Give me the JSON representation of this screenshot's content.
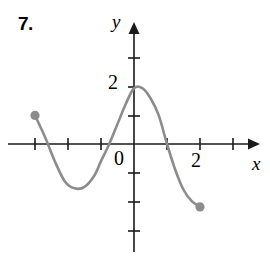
{
  "problem": {
    "number": "7."
  },
  "axes": {
    "y_axis_label": "y",
    "x_axis_label": "x",
    "origin_label": "0",
    "y_tick_label_2": "2",
    "x_tick_label_2": "2",
    "axis_color": "#1a1a1a"
  },
  "chart_data": {
    "type": "line",
    "title": "",
    "xlabel": "x",
    "ylabel": "y",
    "xlim": [
      -4,
      3.6
    ],
    "ylim": [
      -4.1,
      4.1
    ],
    "grid": false,
    "legend": null,
    "curve_color": "#8c8c8c",
    "endpoint_marker": "filled-circle",
    "x_ticks": [
      -3,
      -2,
      -1,
      1,
      2,
      3
    ],
    "y_ticks": [
      -3,
      -2,
      -1,
      1,
      2,
      3
    ],
    "x_tick_labels_shown": [
      {
        "x": 0,
        "label": "0"
      },
      {
        "x": 2,
        "label": "2"
      }
    ],
    "y_tick_labels_shown": [
      {
        "y": 2,
        "label": "2"
      }
    ],
    "series": [
      {
        "name": "f",
        "domain": [
          -3.0,
          2.0
        ],
        "closed_endpoints": true,
        "points": [
          {
            "x": -3.0,
            "y": 1.0
          },
          {
            "x": -2.7,
            "y": 0.25
          },
          {
            "x": -2.4,
            "y": -0.6
          },
          {
            "x": -2.1,
            "y": -1.3
          },
          {
            "x": -1.8,
            "y": -1.55
          },
          {
            "x": -1.5,
            "y": -1.5
          },
          {
            "x": -1.2,
            "y": -1.1
          },
          {
            "x": -1.0,
            "y": -0.6
          },
          {
            "x": -0.75,
            "y": 0.0
          },
          {
            "x": -0.5,
            "y": 0.7
          },
          {
            "x": -0.25,
            "y": 1.4
          },
          {
            "x": 0.0,
            "y": 1.95
          },
          {
            "x": 0.25,
            "y": 1.95
          },
          {
            "x": 0.5,
            "y": 1.6
          },
          {
            "x": 0.75,
            "y": 1.0
          },
          {
            "x": 1.0,
            "y": 0.0
          },
          {
            "x": 1.25,
            "y": -0.9
          },
          {
            "x": 1.5,
            "y": -1.6
          },
          {
            "x": 1.75,
            "y": -2.0
          },
          {
            "x": 2.0,
            "y": -2.2
          }
        ],
        "local_minimum": {
          "x": -1.75,
          "y": -1.55
        },
        "local_maximum": {
          "x": 0.0,
          "y": 2.0
        },
        "x_intercepts": [
          -0.75,
          1.0
        ],
        "y_intercept": 2.0,
        "start_point": {
          "x": -3.0,
          "y": 1.0
        },
        "end_point": {
          "x": 2.0,
          "y": -2.2
        }
      }
    ]
  }
}
